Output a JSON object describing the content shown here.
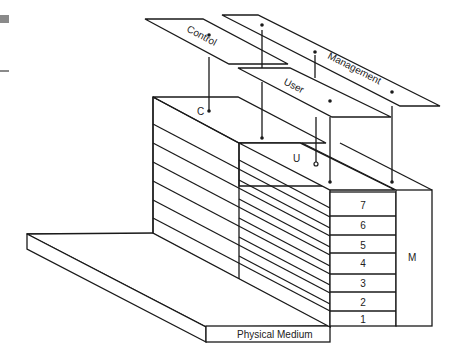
{
  "diagram": {
    "title": "",
    "planes": {
      "control": {
        "label": "Control"
      },
      "management": {
        "label": "Management"
      },
      "user": {
        "label": "User"
      }
    },
    "stack_labels": {
      "control": "C",
      "user": "U",
      "management": "M"
    },
    "layers": [
      {
        "number": "7"
      },
      {
        "number": "6"
      },
      {
        "number": "5"
      },
      {
        "number": "4"
      },
      {
        "number": "3"
      },
      {
        "number": "2"
      },
      {
        "number": "1"
      }
    ],
    "base": {
      "label": "Physical Medium"
    },
    "colors": {
      "stroke": "#1a1a1a",
      "background": "#ffffff"
    }
  }
}
